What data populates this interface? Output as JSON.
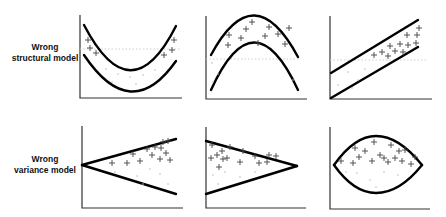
{
  "rows": [
    {
      "label_line1": "Wrong",
      "label_line2": "structural model",
      "panels": [
        {
          "name": "u-shaped-band",
          "description": "Upward-opening parabolic band; data points fall outside the band near edges"
        },
        {
          "name": "inverted-u-band",
          "description": "Downward-opening parabolic band; data points above the band"
        },
        {
          "name": "linear-band",
          "description": "Straight diagonal band; data points in upper right region"
        }
      ]
    },
    {
      "label_line1": "Wrong",
      "label_line2": "variance model",
      "panels": [
        {
          "name": "widening-funnel",
          "description": "Variance increasing from left to right (fan opening right)"
        },
        {
          "name": "narrowing-funnel",
          "description": "Variance decreasing from left to right (fan closing right)"
        },
        {
          "name": "lens-shape",
          "description": "Variance largest in middle, small at ends"
        }
      ]
    }
  ],
  "colors": {
    "curve": "#000000",
    "axis": "#333333",
    "points": "#444444",
    "faint_points": "#bbbbbb"
  },
  "marker_symbol": "+"
}
